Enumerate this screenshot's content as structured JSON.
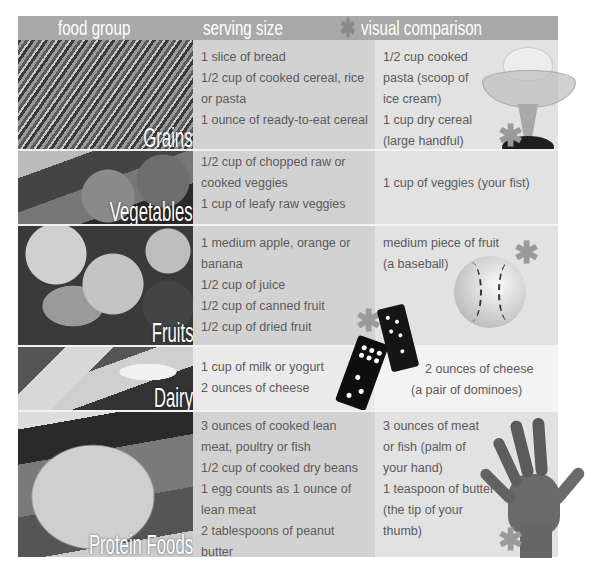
{
  "header": {
    "col1": "food group",
    "col2": "serving size",
    "star": "✱",
    "col3": "visual comparison"
  },
  "rows": [
    {
      "group": "Grains",
      "serving": [
        "1 slice of bread",
        "1/2 cup of cooked cereal, rice",
        "or pasta",
        "1 ounce of ready-to-eat cereal"
      ],
      "visual": [
        "1/2 cup cooked",
        "pasta (scoop of",
        "ice cream)",
        "1 cup dry cereal",
        "(large handful)"
      ],
      "illustration": "ice-cream-dish"
    },
    {
      "group": "Vegetables",
      "serving": [
        "1/2 cup of chopped raw or",
        "cooked veggies",
        "1 cup of leafy raw veggies"
      ],
      "visual": [
        "1 cup of veggies (your fist)"
      ],
      "illustration": "none"
    },
    {
      "group": "Fruits",
      "serving": [
        "1 medium apple, orange or",
        "banana",
        "1/2 cup of juice",
        "1/2 cup of canned fruit",
        "1/2 cup of dried fruit"
      ],
      "visual": [
        "medium piece of fruit",
        "(a baseball)"
      ],
      "illustration": "baseball"
    },
    {
      "group": "Dairy",
      "serving": [
        "1 cup of milk or yogurt",
        "2 ounces of cheese"
      ],
      "visual": [
        "2 ounces of cheese",
        "(a pair of dominoes)"
      ],
      "illustration": "dominoes"
    },
    {
      "group": "Protein Foods",
      "serving": [
        "3 ounces of cooked lean",
        "meat, poultry or fish",
        "1/2 cup of cooked dry beans",
        "1 egg counts as 1 ounce of",
        "lean meat",
        "2 tablespoons of peanut butter"
      ],
      "visual": [
        "3 ounces of meat",
        "or fish (palm of",
        "your hand)",
        "1 teaspoon of butter",
        "(the tip of your",
        "thumb)"
      ],
      "illustration": "hand"
    }
  ],
  "colors": {
    "header_bg": "#a9a9a9",
    "serving_bg": "#d2d2d2",
    "visual_bg": "#e2e2e2",
    "text": "#5a5a5a",
    "star": "#9a9a9a"
  }
}
